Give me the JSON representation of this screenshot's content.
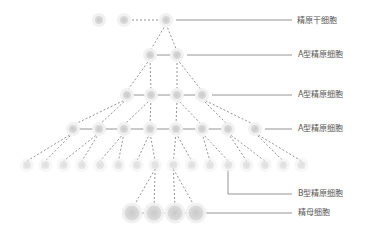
{
  "labels": [
    {
      "text": "精原干细胞",
      "x": 297,
      "y": 16
    },
    {
      "text": "A型精原细胞",
      "x": 298,
      "y": 50
    },
    {
      "text": "A型精原细胞",
      "x": 298,
      "y": 90
    },
    {
      "text": "A型精原细胞",
      "x": 298,
      "y": 124
    },
    {
      "text": "B型精原细胞",
      "x": 298,
      "y": 189
    },
    {
      "text": "精母细胞",
      "x": 298,
      "y": 208
    }
  ],
  "colors": {
    "cell": "#cfcfcf",
    "halo": "#ececec",
    "line": "#666666"
  }
}
